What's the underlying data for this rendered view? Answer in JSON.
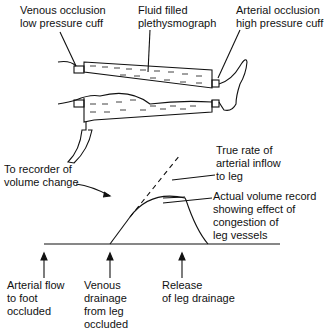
{
  "labels": {
    "venous_cuff": "Venous occlusion\nlow pressure cuff",
    "plethysmograph": "Fluid filled\nplethysmograph",
    "arterial_cuff": "Arterial occlusion\nhigh pressure cuff",
    "recorder": "To recorder of\nvolume change",
    "true_rate": "True rate of\narterial inflow\nto leg",
    "actual_record": "Actual volume record\nshowing effect of\ncongestion of\nleg vessels",
    "arterial_flow": "Arterial flow\nto foot\noccluded",
    "venous_drainage": "Venous\ndrainage\nfrom leg\noccluded",
    "release": "Release\nof leg drainage"
  }
}
